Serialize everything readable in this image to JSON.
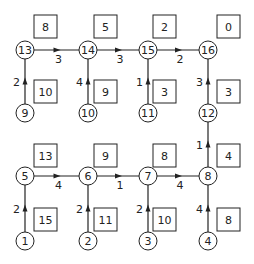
{
  "diagram": {
    "nodes": [
      {
        "id": "1",
        "x": 25,
        "y": 241
      },
      {
        "id": "2",
        "x": 88,
        "y": 241
      },
      {
        "id": "3",
        "x": 148,
        "y": 241
      },
      {
        "id": "4",
        "x": 208,
        "y": 241
      },
      {
        "id": "5",
        "x": 25,
        "y": 176
      },
      {
        "id": "6",
        "x": 88,
        "y": 176
      },
      {
        "id": "7",
        "x": 148,
        "y": 176
      },
      {
        "id": "8",
        "x": 208,
        "y": 176
      },
      {
        "id": "9",
        "x": 25,
        "y": 113
      },
      {
        "id": "10",
        "x": 88,
        "y": 113
      },
      {
        "id": "11",
        "x": 148,
        "y": 113
      },
      {
        "id": "12",
        "x": 208,
        "y": 113
      },
      {
        "id": "13",
        "x": 25,
        "y": 50
      },
      {
        "id": "14",
        "x": 88,
        "y": 50
      },
      {
        "id": "15",
        "x": 148,
        "y": 50
      },
      {
        "id": "16",
        "x": 208,
        "y": 50
      }
    ],
    "edges": [
      {
        "from": "9",
        "to": "13",
        "weight": "2",
        "dir": "v"
      },
      {
        "from": "10",
        "to": "14",
        "weight": "4",
        "dir": "v"
      },
      {
        "from": "11",
        "to": "15",
        "weight": "1",
        "dir": "v"
      },
      {
        "from": "12",
        "to": "16",
        "weight": "3",
        "dir": "v"
      },
      {
        "from": "13",
        "to": "14",
        "weight": "3",
        "dir": "h"
      },
      {
        "from": "14",
        "to": "15",
        "weight": "3",
        "dir": "h"
      },
      {
        "from": "15",
        "to": "16",
        "weight": "2",
        "dir": "h"
      },
      {
        "from": "8",
        "to": "12",
        "weight": "1",
        "dir": "v"
      },
      {
        "from": "1",
        "to": "5",
        "weight": "2",
        "dir": "v"
      },
      {
        "from": "2",
        "to": "6",
        "weight": "2",
        "dir": "v"
      },
      {
        "from": "3",
        "to": "7",
        "weight": "2",
        "dir": "v"
      },
      {
        "from": "4",
        "to": "8",
        "weight": "4",
        "dir": "v"
      },
      {
        "from": "5",
        "to": "6",
        "weight": "4",
        "dir": "h"
      },
      {
        "from": "6",
        "to": "7",
        "weight": "1",
        "dir": "h"
      },
      {
        "from": "7",
        "to": "8",
        "weight": "4",
        "dir": "h"
      }
    ],
    "boxes": [
      {
        "value": "8",
        "x": 34,
        "y": 15
      },
      {
        "value": "5",
        "x": 94,
        "y": 15
      },
      {
        "value": "2",
        "x": 153,
        "y": 15
      },
      {
        "value": "0",
        "x": 217,
        "y": 15
      },
      {
        "value": "10",
        "x": 34,
        "y": 80
      },
      {
        "value": "9",
        "x": 94,
        "y": 80
      },
      {
        "value": "3",
        "x": 153,
        "y": 80
      },
      {
        "value": "3",
        "x": 217,
        "y": 80
      },
      {
        "value": "4",
        "x": 217,
        "y": 144
      },
      {
        "value": "13",
        "x": 34,
        "y": 144
      },
      {
        "value": "9",
        "x": 94,
        "y": 144
      },
      {
        "value": "8",
        "x": 153,
        "y": 144
      },
      {
        "value": "15",
        "x": 34,
        "y": 208
      },
      {
        "value": "11",
        "x": 94,
        "y": 208
      },
      {
        "value": "10",
        "x": 153,
        "y": 208
      },
      {
        "value": "8",
        "x": 217,
        "y": 208
      }
    ]
  },
  "style": {
    "stroke": "#222222",
    "background": "#ffffff"
  }
}
